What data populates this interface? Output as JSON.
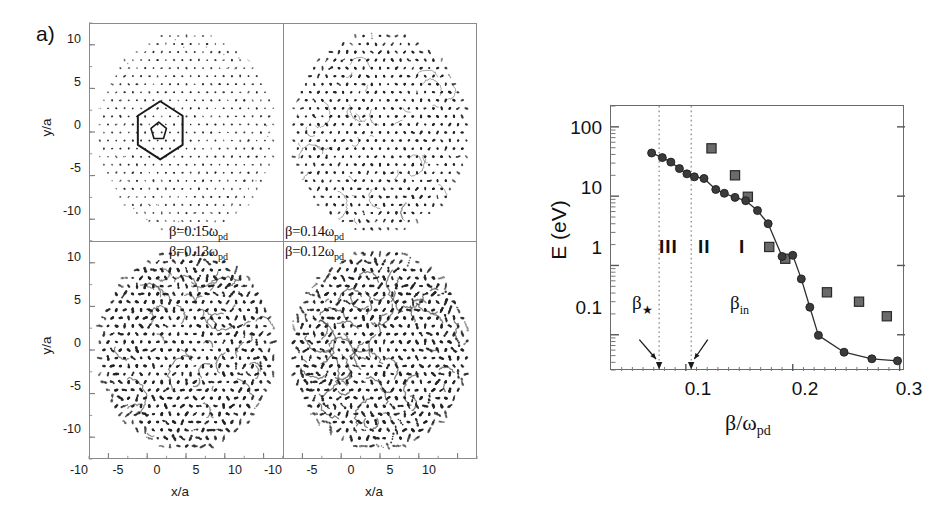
{
  "figure": {
    "panel_a_letter": "a)",
    "panel_b_letter": "b)"
  },
  "panel_a": {
    "xlabel": "x/a",
    "ylabel": "y/a",
    "xticks": [
      "-10",
      "-5",
      "0",
      "5",
      "10"
    ],
    "yticks": [
      "10",
      "5",
      "0",
      "-5",
      "-10"
    ],
    "xlim": [
      -12.5,
      12.5
    ],
    "ylim": [
      -12.5,
      12.5
    ],
    "quadrants": [
      {
        "id": "top-left",
        "beta_label": "β=0.15ω",
        "beta_sub": "pd",
        "density": 0.32,
        "disorder": 0.1,
        "dotscale": 0.55
      },
      {
        "id": "top-right",
        "beta_label": "β=0.14ω",
        "beta_sub": "pd",
        "density": 0.62,
        "disorder": 0.22,
        "dotscale": 0.85
      },
      {
        "id": "bottom-left",
        "beta_label": "β=0.13ω",
        "beta_sub": "pd",
        "density": 0.92,
        "disorder": 0.42,
        "dotscale": 1.05
      },
      {
        "id": "bottom-right",
        "beta_label": "β=0.12ω",
        "beta_sub": "pd",
        "density": 0.95,
        "disorder": 0.5,
        "dotscale": 1.05
      }
    ],
    "overlay_shapes": {
      "hexagon": "defect-hexagon-outline",
      "pentagon": "defect-pentagon-outline"
    }
  },
  "chart_data": {
    "type": "scatter",
    "title": "",
    "xlabel": "β/ω",
    "xlabel_sub": "pd",
    "ylabel": "E (eV)",
    "xlim": [
      0.03,
      0.305
    ],
    "ylim": [
      0.03,
      200
    ],
    "yscale": "log",
    "xscale": "linear",
    "grid": false,
    "legend": null,
    "xticks": [
      "0.1",
      "0.2",
      "0.3"
    ],
    "xtick_values": [
      0.1,
      0.2,
      0.3
    ],
    "yticks": [
      "100",
      "10",
      "1",
      "0.1"
    ],
    "ytick_values": [
      100,
      10,
      1,
      0.1
    ],
    "series": [
      {
        "name": "simulation-circles",
        "marker": "circle",
        "color": "#3b3b3b",
        "connected": true,
        "points": [
          [
            0.068,
            42.0
          ],
          [
            0.078,
            36.0
          ],
          [
            0.086,
            31.0
          ],
          [
            0.094,
            25.0
          ],
          [
            0.101,
            21.0
          ],
          [
            0.108,
            19.0
          ],
          [
            0.117,
            18.0
          ],
          [
            0.128,
            12.5
          ],
          [
            0.136,
            11.0
          ],
          [
            0.146,
            9.6
          ],
          [
            0.156,
            8.6
          ],
          [
            0.167,
            6.2
          ],
          [
            0.177,
            4.0
          ],
          [
            0.19,
            1.35
          ],
          [
            0.2,
            1.4
          ],
          [
            0.208,
            0.64
          ],
          [
            0.216,
            0.25
          ],
          [
            0.224,
            0.098
          ],
          [
            0.248,
            0.056
          ],
          [
            0.274,
            0.045
          ],
          [
            0.298,
            0.042
          ]
        ]
      },
      {
        "name": "experiment-squares",
        "marker": "square",
        "color": "#6a6a6a",
        "connected": false,
        "points": [
          [
            0.124,
            49.0
          ],
          [
            0.146,
            20.0
          ],
          [
            0.158,
            9.8
          ],
          [
            0.178,
            1.85
          ],
          [
            0.193,
            1.25
          ],
          [
            0.232,
            0.41
          ],
          [
            0.262,
            0.3
          ],
          [
            0.288,
            0.185
          ]
        ]
      }
    ],
    "annotations": [
      {
        "name": "region-III",
        "text": "III",
        "x": 0.063,
        "y": 1.0
      },
      {
        "name": "region-II",
        "text": "II",
        "x": 0.089,
        "y": 1.0
      },
      {
        "name": "region-I",
        "text": "I",
        "x": 0.115,
        "y": 1.0
      },
      {
        "name": "beta-star",
        "text": "β",
        "sub": "★",
        "x": 0.049,
        "y": 0.115,
        "arrow_to_x": 0.075
      },
      {
        "name": "beta-in",
        "text": "β",
        "sub": "in",
        "x": 0.118,
        "y": 0.115,
        "arrow_to_x": 0.105
      }
    ],
    "vlines": [
      {
        "name": "beta-star-line",
        "x": 0.075,
        "style": "dotted"
      },
      {
        "name": "beta-in-line",
        "x": 0.105,
        "style": "dotted"
      }
    ]
  }
}
